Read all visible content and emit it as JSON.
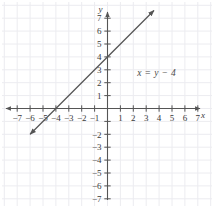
{
  "figure": {
    "title": "",
    "equation_label": "x = y − 4",
    "axis_labels": {
      "x": "x",
      "y": "y"
    }
  },
  "chart_data": {
    "type": "line",
    "title": "",
    "xlabel": "x",
    "ylabel": "y",
    "xlim": [
      -7.9,
      7.9
    ],
    "ylim": [
      -7.9,
      7.9
    ],
    "grid": true,
    "grid_color": "#ececf0",
    "axis_color": "#555555",
    "line_color": "#555555",
    "background": "#ffffff",
    "annotations": [
      {
        "text": "x = y − 4",
        "x": 2.3,
        "y": 2.55
      }
    ],
    "series": [
      {
        "name": "x = y − 4",
        "equation": "y = x + 4",
        "slope": 1,
        "intercept": 4,
        "x_intercept": -4,
        "y_intercept": 4,
        "arrows": "both",
        "points": [
          {
            "x": -6.0,
            "y": -2.0
          },
          {
            "x": -4.0,
            "y": 0.0
          },
          {
            "x": 0.0,
            "y": 4.0
          },
          {
            "x": 3.6,
            "y": 7.6
          }
        ],
        "x_range": [
          -6.0,
          3.6
        ]
      }
    ],
    "x_ticks": [
      {
        "value": -7,
        "label": "−7"
      },
      {
        "value": -6,
        "label": "−6"
      },
      {
        "value": -5,
        "label": "−5"
      },
      {
        "value": -4,
        "label": "−4"
      },
      {
        "value": -3,
        "label": "−3"
      },
      {
        "value": -2,
        "label": "−2"
      },
      {
        "value": -1,
        "label": "−1"
      },
      {
        "value": 1,
        "label": "1"
      },
      {
        "value": 2,
        "label": "2"
      },
      {
        "value": 3,
        "label": "3"
      },
      {
        "value": 4,
        "label": "4"
      },
      {
        "value": 5,
        "label": "5"
      },
      {
        "value": 6,
        "label": "6"
      },
      {
        "value": 7,
        "label": "7"
      }
    ],
    "y_ticks": [
      {
        "value": 7,
        "label": "7"
      },
      {
        "value": 6,
        "label": "6"
      },
      {
        "value": 5,
        "label": "5"
      },
      {
        "value": 4,
        "label": "4"
      },
      {
        "value": 3,
        "label": "3"
      },
      {
        "value": 2,
        "label": "2"
      },
      {
        "value": 1,
        "label": "1"
      },
      {
        "value": -2,
        "label": "−2"
      },
      {
        "value": -3,
        "label": "−3"
      },
      {
        "value": -4,
        "label": "−4"
      },
      {
        "value": -5,
        "label": "−5"
      },
      {
        "value": -6,
        "label": "−6"
      },
      {
        "value": -7,
        "label": "−7"
      }
    ]
  }
}
